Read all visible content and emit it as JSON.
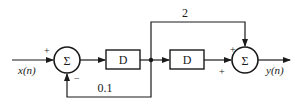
{
  "diagram": {
    "type": "signal-flow block diagram",
    "input": {
      "label": "x(n)"
    },
    "output": {
      "label": "y(n)"
    },
    "sum1": {
      "symbol": "Σ",
      "input_sign": "+",
      "feedback_sign": "−"
    },
    "delay1": {
      "label": "D"
    },
    "delay2": {
      "label": "D"
    },
    "sum2": {
      "symbol": "Σ",
      "top_sign": "+",
      "left_sign": "+"
    },
    "feedforward_gain": {
      "label": "2"
    },
    "feedback_gain": {
      "label": "0.1"
    }
  },
  "colors": {
    "stroke": "#1a1a1a",
    "background": "#ffffff"
  }
}
